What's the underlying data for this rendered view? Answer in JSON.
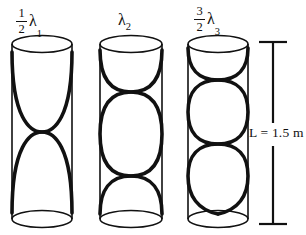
{
  "figure": {
    "background_color": "#ffffff",
    "stroke_color": "#111111",
    "width": 306,
    "height": 235
  },
  "tubes": [
    {
      "id": "tube-1",
      "harmonic": 1,
      "label": {
        "numerator": "1",
        "denominator": "2",
        "symbol": "λ",
        "subscript": "1",
        "text": "1/2 λ1"
      },
      "antinodes": 1,
      "internal_nodes": 1,
      "wavelengths_in_tube": 0.5,
      "geometry": {
        "left": 12,
        "right": 72,
        "top": 44,
        "bottom": 219,
        "ellipse_ry": 9
      }
    },
    {
      "id": "tube-2",
      "harmonic": 2,
      "label": {
        "numerator": "",
        "denominator": "",
        "symbol": "λ",
        "subscript": "2",
        "text": "λ2"
      },
      "antinodes": 2,
      "internal_nodes": 2,
      "wavelengths_in_tube": 1.0,
      "geometry": {
        "left": 100,
        "right": 162,
        "top": 44,
        "bottom": 219,
        "ellipse_ry": 9
      }
    },
    {
      "id": "tube-3",
      "harmonic": 3,
      "label": {
        "numerator": "3",
        "denominator": "2",
        "symbol": "λ",
        "subscript": "3",
        "text": "3/2 λ3"
      },
      "antinodes": 3,
      "internal_nodes": 3,
      "wavelengths_in_tube": 1.5,
      "geometry": {
        "left": 188,
        "right": 248,
        "top": 44,
        "bottom": 219,
        "ellipse_ry": 9
      }
    }
  ],
  "dimension": {
    "label": "L = 1.5 m",
    "quantity": "L",
    "value": "1.5",
    "unit": "m",
    "line_x": 272,
    "top_y": 42,
    "bottom_y": 224
  }
}
